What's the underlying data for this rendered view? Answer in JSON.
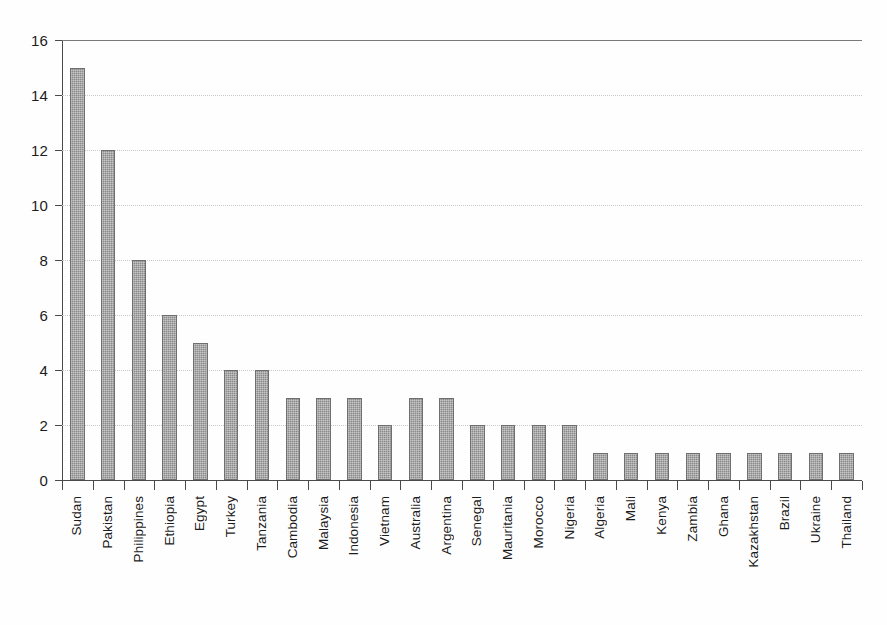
{
  "chart_data": {
    "type": "bar",
    "title": "",
    "subtitle": "",
    "xlabel": "",
    "ylabel": "",
    "ylim": [
      0,
      16
    ],
    "ytick_step": 2,
    "yticks": [
      0,
      2,
      4,
      6,
      8,
      10,
      12,
      14,
      16
    ],
    "grid": true,
    "grid_axis": "y",
    "legend": false,
    "legend_position": "none",
    "orientation": "vertical",
    "bar_color": "#8a8a8a",
    "bar_edge_color": "#6f6f6f",
    "axis_color": "#4a4a4a",
    "grid_color": "#c9c9c9",
    "label_rotation": 90,
    "categories": [
      "Sudan",
      "Pakistan",
      "Philippines",
      "Ethiopia",
      "Egypt",
      "Turkey",
      "Tanzania",
      "Cambodia",
      "Malaysia",
      "Indonesia",
      "Vietnam",
      "Australia",
      "Argentina",
      "Senegal",
      "Mauritania",
      "Morocco",
      "Nigeria",
      "Algeria",
      "Mali",
      "Kenya",
      "Zambia",
      "Ghana",
      "Kazakhstan",
      "Brazil",
      "Ukraine",
      "Thailand"
    ],
    "values": [
      15,
      12,
      8,
      6,
      5,
      4,
      4,
      3,
      3,
      3,
      2,
      3,
      3,
      2,
      2,
      2,
      2,
      1,
      1,
      1,
      1,
      1,
      1,
      1,
      1,
      1
    ]
  }
}
